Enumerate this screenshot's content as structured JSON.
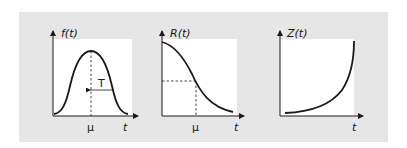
{
  "colors": {
    "panel_background": "#e6e6e6",
    "plot_background": "#ffffff",
    "line": "#1a1a1a"
  },
  "plots": [
    {
      "id": "pdf",
      "y_label": "f(t)",
      "x_label": "t",
      "marker_label": "μ",
      "annotation_label": "T",
      "description": "bell-shaped probability density with peak at μ; T denotes spread from μ"
    },
    {
      "id": "reliability",
      "y_label": "R(t)",
      "x_label": "t",
      "marker_label": "μ",
      "description": "decreasing S-shaped reliability curve; dashed lines mark value at μ"
    },
    {
      "id": "hazard",
      "y_label": "Z(t)",
      "x_label": "t",
      "description": "increasing convex hazard rate curve"
    }
  ]
}
